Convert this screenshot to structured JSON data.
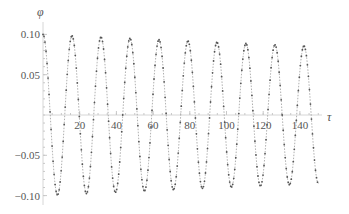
{
  "chart_data": {
    "type": "line",
    "title": "",
    "xlabel": "τ",
    "ylabel": "φ",
    "xlim": [
      0,
      152
    ],
    "ylim": [
      -0.105,
      0.105
    ],
    "grid": false,
    "legend": null,
    "x_ticks": [
      20,
      40,
      60,
      80,
      100,
      120,
      140
    ],
    "x_tick_labels": [
      "20",
      "40",
      "60",
      "80",
      "100",
      "120",
      "140"
    ],
    "y_ticks": [
      0.1,
      0.05,
      -0.05,
      -0.1
    ],
    "y_tick_labels": [
      "0.10",
      "0.05",
      "−0.05",
      "−0.10"
    ],
    "series": [
      {
        "name": "φ(τ)",
        "style": "dotted markers over dashed line",
        "color": "#555555",
        "description": "damped cosine oscillation, amplitude ≈0.10 decaying to ≈0.085, period ≈15.8",
        "amplitude_start": 0.1,
        "amplitude_end": 0.085,
        "period": 15.8,
        "x_end": 150,
        "peaks_x": [
          0,
          15.8,
          31.6,
          47.4,
          63.2,
          79.0,
          94.8,
          110.6,
          126.4,
          142.2
        ],
        "peaks_y": [
          0.1,
          0.098,
          0.097,
          0.095,
          0.094,
          0.092,
          0.091,
          0.089,
          0.088,
          0.086
        ],
        "troughs_x": [
          7.9,
          23.7,
          39.5,
          55.3,
          71.1,
          86.9,
          102.7,
          118.5,
          134.3
        ],
        "troughs_y": [
          -0.099,
          -0.098,
          -0.096,
          -0.095,
          -0.093,
          -0.092,
          -0.09,
          -0.089,
          -0.087
        ]
      }
    ]
  }
}
